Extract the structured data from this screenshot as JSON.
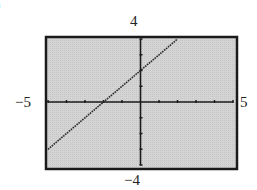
{
  "panel": {
    "label": ")"
  },
  "chart_data": {
    "type": "line",
    "title": "",
    "xlabel": "",
    "ylabel": "",
    "xlim": [
      -5,
      5
    ],
    "ylim": [
      -4,
      4
    ],
    "xtick_step": 1,
    "ytick_step": 1,
    "grid": false,
    "legend": null,
    "window_labels": {
      "xmin": "−5",
      "xmax": "5",
      "ymin": "−4",
      "ymax": "4"
    },
    "series": [
      {
        "name": "y = x + 2",
        "equation": "y = x + 2",
        "slope": 1,
        "intercept": 2,
        "x": [
          -5,
          -4,
          -3,
          -2,
          -1,
          0,
          1,
          2
        ],
        "y": [
          -3,
          -2,
          -1,
          0,
          1,
          2,
          3,
          4
        ]
      }
    ],
    "colors": {
      "background": "#d4d4d4",
      "frame": "#1a1a1a",
      "line": "#2a2a2a",
      "axes": "#1a1a1a"
    }
  }
}
